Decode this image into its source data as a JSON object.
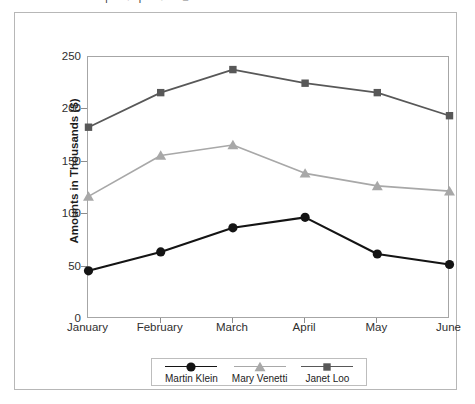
{
  "figure": {
    "cut_text_above": "| ●| ● ■"
  },
  "chart_data": {
    "type": "line",
    "title": "",
    "xlabel": "",
    "ylabel": "Amounts in Thousands ($)",
    "categories": [
      "January",
      "February",
      "March",
      "April",
      "May",
      "June"
    ],
    "ylim": [
      0,
      250
    ],
    "yticks": [
      0,
      50,
      100,
      150,
      200,
      250
    ],
    "ytick_labels": [
      "0",
      "50",
      "100",
      "150",
      "200",
      "250"
    ],
    "grid": false,
    "legend_position": "bottom",
    "series": [
      {
        "name": "Martin Klein",
        "marker": "circle",
        "color": "#141414",
        "values": [
          46,
          64,
          87,
          97,
          62,
          52
        ]
      },
      {
        "name": "Mary Venetti",
        "marker": "triangle",
        "color": "#a8a8a8",
        "values": [
          117,
          156,
          166,
          139,
          127,
          122
        ]
      },
      {
        "name": "Janet Loo",
        "marker": "square",
        "color": "#585858",
        "values": [
          183,
          216,
          238,
          225,
          216,
          194
        ]
      }
    ]
  },
  "colors": {
    "figure_border": "#b7b7b7",
    "plot_border": "#a6a6a6",
    "axis_tick": "#8d8d8d",
    "text": "#2f2f2f"
  }
}
